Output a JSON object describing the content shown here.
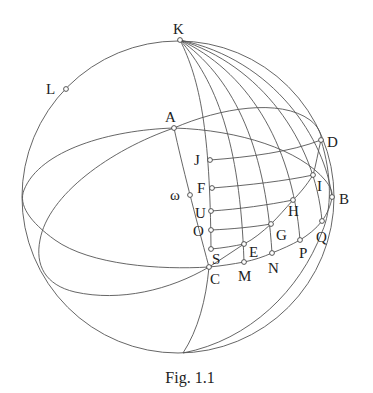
{
  "figure": {
    "caption": "Fig. 1.1",
    "stroke_color": "#555555",
    "sphere": {
      "cx": 178,
      "cy": 197,
      "r": 156
    }
  },
  "points": [
    {
      "id": "K",
      "label": "K",
      "x": 180,
      "y": 40,
      "lx": 173,
      "ly": 34
    },
    {
      "id": "L",
      "label": "L",
      "x": 66,
      "y": 89,
      "lx": 46,
      "ly": 94
    },
    {
      "id": "A",
      "label": "A",
      "x": 174,
      "y": 128,
      "lx": 165,
      "ly": 122
    },
    {
      "id": "D",
      "label": "D",
      "x": 321,
      "y": 140,
      "lx": 327,
      "ly": 147
    },
    {
      "id": "J",
      "label": "J",
      "x": 210,
      "y": 160,
      "lx": 194,
      "ly": 165
    },
    {
      "id": "I",
      "label": "I",
      "x": 313,
      "y": 175,
      "lx": 317,
      "ly": 191
    },
    {
      "id": "F",
      "label": "F",
      "x": 212,
      "y": 188,
      "lx": 197,
      "ly": 193
    },
    {
      "id": "omega",
      "label": "ω",
      "x": 190,
      "y": 195,
      "lx": 170,
      "ly": 200
    },
    {
      "id": "B",
      "label": "B",
      "x": 332,
      "y": 197,
      "lx": 339,
      "ly": 204
    },
    {
      "id": "H",
      "label": "H",
      "x": 293,
      "y": 200,
      "lx": 288,
      "ly": 216
    },
    {
      "id": "U",
      "label": "U",
      "x": 211,
      "y": 211,
      "lx": 195,
      "ly": 218
    },
    {
      "id": "Q",
      "label": "Q",
      "x": 322,
      "y": 221,
      "lx": 316,
      "ly": 242
    },
    {
      "id": "G",
      "label": "G",
      "x": 271,
      "y": 224,
      "lx": 276,
      "ly": 240
    },
    {
      "id": "O",
      "label": "O",
      "x": 211,
      "y": 230,
      "lx": 193,
      "ly": 236
    },
    {
      "id": "P",
      "label": "P",
      "x": 300,
      "y": 240,
      "lx": 299,
      "ly": 258
    },
    {
      "id": "E",
      "label": "E",
      "x": 244,
      "y": 244,
      "lx": 249,
      "ly": 257
    },
    {
      "id": "S",
      "label": "S",
      "x": 211,
      "y": 249,
      "lx": 212,
      "ly": 264
    },
    {
      "id": "N",
      "label": "N",
      "x": 272,
      "y": 253,
      "lx": 268,
      "ly": 273
    },
    {
      "id": "M",
      "label": "M",
      "x": 244,
      "y": 262,
      "lx": 238,
      "ly": 281
    },
    {
      "id": "C",
      "label": "C",
      "x": 209,
      "y": 267,
      "lx": 210,
      "ly": 284
    }
  ]
}
